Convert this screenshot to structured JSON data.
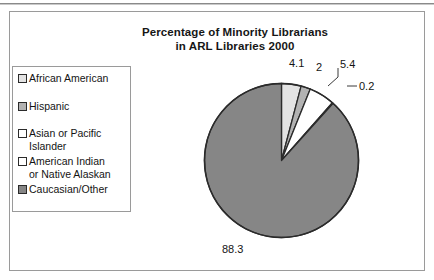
{
  "figure": {
    "title_line1": "Percentage of Minority Librarians",
    "title_line2": "in ARL Libraries 2000"
  },
  "legend": {
    "items": [
      {
        "label": "African American",
        "color": "#e3e3e3",
        "value": 4.1
      },
      {
        "label": "Hispanic",
        "color": "#b2b2b2",
        "value": 2
      },
      {
        "label": "Asian or Pacific\nIslander",
        "color": "#ffffff",
        "value": 5.4
      },
      {
        "label": "American Indian\nor Native Alaskan",
        "color": "#ffffff",
        "value": 0.2
      },
      {
        "label": "Caucasian/Other",
        "color": "#868686",
        "value": 88.3
      }
    ]
  },
  "data_labels": {
    "african_american": "4.1",
    "hispanic": "2",
    "asian_pacific": "5.4",
    "american_indian": "0.2",
    "caucasian_other": "88.3"
  },
  "chart_data": {
    "type": "pie",
    "title": "Percentage of Minority Librarians in ARL Libraries 2000",
    "categories": [
      "African American",
      "Hispanic",
      "Asian or Pacific Islander",
      "American Indian or Native Alaskan",
      "Caucasian/Other"
    ],
    "values": [
      4.1,
      2,
      5.4,
      0.2,
      88.3
    ],
    "labels": [
      "4.1",
      "2",
      "5.4",
      "0.2",
      "88.3"
    ],
    "colors": [
      "#e3e3e3",
      "#b2b2b2",
      "#ffffff",
      "#ffffff",
      "#868686"
    ],
    "units": "percent",
    "start_angle_deg": 0,
    "direction": "clockwise",
    "legend_position": "left",
    "grid": false
  }
}
